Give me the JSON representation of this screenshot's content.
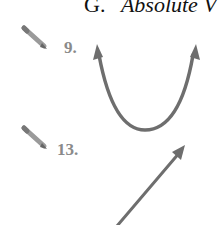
{
  "section_header": {
    "letter": "G.",
    "title": "Absolute V"
  },
  "problems": [
    {
      "number": "9.",
      "icon": "pencil-icon",
      "graph": "upward parabola with arrows at both ends"
    },
    {
      "number": "13.",
      "icon": "pencil-icon",
      "graph": "straight line with arrow pointing up-right"
    }
  ],
  "colors": {
    "curve": "#6e6e6e",
    "label": "#8a8a8a",
    "header": "#111111"
  }
}
